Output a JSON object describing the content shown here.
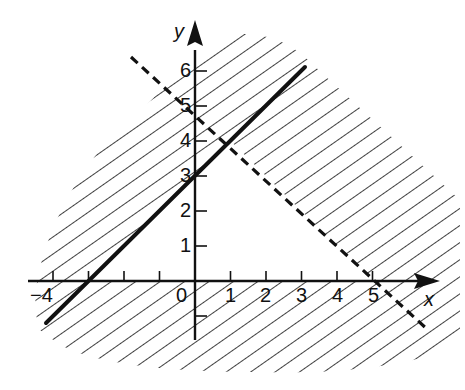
{
  "figure": {
    "type": "graph-of-system-of-inequalities",
    "axes": {
      "x_label": "x",
      "y_label": "y",
      "x_tick_labels": [
        "−4",
        "0",
        "1",
        "2",
        "3",
        "4",
        "5"
      ],
      "x_ticks": [
        -4,
        -3,
        -2,
        -1,
        1,
        2,
        3,
        4,
        5
      ],
      "y_tick_labels": [
        "1",
        "2",
        "3",
        "4",
        "5",
        "6"
      ],
      "y_ticks": [
        -1,
        1,
        2,
        3,
        4,
        5,
        6
      ],
      "origin_label": "0"
    },
    "lines": [
      {
        "name": "boundary-solid",
        "equation": "y = x + 3",
        "style": "solid",
        "from": [
          -4.2,
          -1.2
        ],
        "to": [
          3.1,
          6.1
        ]
      },
      {
        "name": "boundary-dashed",
        "equation": "x + y = 5",
        "style": "dashed",
        "from": [
          -1.8,
          6.4
        ],
        "to": [
          6.3,
          -1.4
        ]
      }
    ],
    "unshaded_region_vertices": [
      [
        -3,
        0
      ],
      [
        1,
        4
      ],
      [
        5,
        0
      ]
    ],
    "shading": "diagonal hatching outside the triangular solution region",
    "colors": {
      "ink": "#111111",
      "background": "#ffffff"
    }
  }
}
